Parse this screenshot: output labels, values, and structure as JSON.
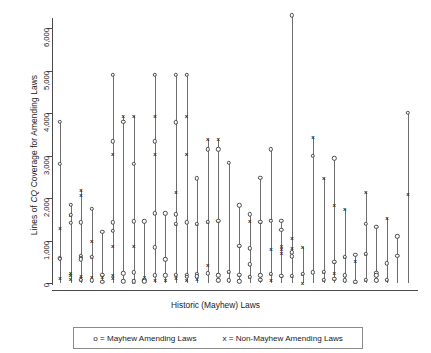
{
  "chart_data": {
    "type": "scatter",
    "title": "",
    "xlabel": "Historic (Mayhew) Laws",
    "ylabel": "Lines of CQ Coverage for Amending Laws",
    "ylabel_parts": {
      "pre": "Lines of ",
      "italic": "CQ",
      "post": " Coverage for Amending Laws"
    },
    "ylim": [
      0,
      6500
    ],
    "yticks": [
      0,
      1000,
      2000,
      3000,
      4000,
      5000,
      6000
    ],
    "ytick_labels": [
      "0",
      "1,000",
      "2,000",
      "3,000",
      "4,000",
      "5,000",
      "6,000"
    ],
    "grid": false,
    "xtick_labels": [],
    "legend": {
      "position": "below-axis-box",
      "entries": [
        {
          "marker": "o",
          "label": "o = Mayhew Amending Laws"
        },
        {
          "marker": "x",
          "label": "x = Non-Mayhew Amending Laws"
        }
      ]
    },
    "series": [
      {
        "name": "Mayhew Amending Laws",
        "marker": "o"
      },
      {
        "name": "Non-Mayhew Amending Laws",
        "marker": "x"
      }
    ],
    "stems": [
      {
        "x": 1,
        "top": 3800,
        "o": [
          3800,
          2800,
          580,
          570
        ],
        "xs": [
          1300,
          120
        ]
      },
      {
        "x": 2,
        "top": 1840,
        "o": [
          1840,
          1600,
          1420
        ],
        "xs": [
          1600,
          240,
          180,
          90
        ]
      },
      {
        "x": 3,
        "top": 2200,
        "o": [
          1430,
          640,
          600,
          560,
          80
        ],
        "xs": [
          2200,
          2080,
          640,
          600,
          170,
          120,
          60
        ]
      },
      {
        "x": 4,
        "top": 1740,
        "o": [
          1740,
          620,
          60
        ],
        "xs": [
          1000,
          620,
          150
        ]
      },
      {
        "x": 5,
        "top": 1200,
        "o": [
          1200,
          200,
          30
        ],
        "xs": [
          200,
          140
        ]
      },
      {
        "x": 6,
        "top": 4900,
        "o": [
          4900,
          3330,
          1430,
          1230
        ],
        "xs": [
          3030,
          880,
          200,
          120
        ]
      },
      {
        "x": 7,
        "top": 3940,
        "o": [
          3800,
          230,
          40
        ],
        "xs": [
          3940,
          40
        ]
      },
      {
        "x": 8,
        "top": 3920,
        "o": [
          2800,
          1450,
          250,
          40
        ],
        "xs": [
          3920,
          880,
          60,
          30
        ]
      },
      {
        "x": 9,
        "top": 1450,
        "o": [
          1450,
          60,
          40
        ],
        "xs": [
          130,
          60
        ]
      },
      {
        "x": 10,
        "top": 4900,
        "o": [
          4900,
          3330,
          1640,
          840,
          180
        ],
        "xs": [
          3940,
          3030,
          1640,
          180,
          80
        ]
      },
      {
        "x": 11,
        "top": 1640,
        "o": [
          1640,
          560,
          180
        ],
        "xs": [
          560,
          180,
          70
        ]
      },
      {
        "x": 12,
        "top": 4900,
        "o": [
          4900,
          3780,
          1620,
          1400,
          200
        ],
        "xs": [
          3800,
          2150,
          1620,
          1400,
          200,
          120
        ]
      },
      {
        "x": 13,
        "top": 4900,
        "o": [
          4900,
          1430,
          200,
          150
        ],
        "xs": [
          3940,
          3030,
          1430,
          200,
          80
        ]
      },
      {
        "x": 14,
        "top": 2460,
        "o": [
          2460,
          1400,
          220,
          160
        ],
        "xs": [
          1400,
          220,
          160,
          90
        ]
      },
      {
        "x": 15,
        "top": 3400,
        "o": [
          3150,
          1440,
          230
        ],
        "xs": [
          3400,
          1440,
          420,
          230
        ]
      },
      {
        "x": 16,
        "top": 3400,
        "o": [
          3150,
          1460,
          180,
          60
        ],
        "xs": [
          3400,
          1460,
          220,
          60
        ]
      },
      {
        "x": 17,
        "top": 2830,
        "o": [
          2830,
          260,
          60
        ],
        "xs": [
          260,
          60
        ]
      },
      {
        "x": 18,
        "top": 1830,
        "o": [
          1830,
          880,
          190,
          40
        ],
        "xs": [
          880,
          190,
          60
        ]
      },
      {
        "x": 19,
        "top": 1620,
        "o": [
          1620,
          820,
          440,
          150
        ],
        "xs": [
          1460,
          820,
          440,
          150
        ]
      },
      {
        "x": 20,
        "top": 2470,
        "o": [
          2470,
          1440,
          180,
          70
        ],
        "xs": [
          1440,
          180,
          70
        ]
      },
      {
        "x": 21,
        "top": 3150,
        "o": [
          3150,
          1460,
          210
        ],
        "xs": [
          1490,
          790,
          210,
          60
        ]
      },
      {
        "x": 22,
        "top": 1470,
        "o": [
          1470,
          1250,
          170
        ],
        "xs": [
          880,
          790,
          700,
          170
        ]
      },
      {
        "x": 23,
        "top": 6300,
        "o": [
          6300,
          720,
          630,
          170
        ],
        "xs": [
          1060,
          830,
          720,
          630,
          170
        ]
      },
      {
        "x": 24,
        "top": 840,
        "o": [
          220
        ],
        "xs": [
          840,
          220,
          0
        ]
      },
      {
        "x": 25,
        "top": 3430,
        "o": [
          3000,
          250
        ],
        "xs": [
          3430,
          250
        ]
      },
      {
        "x": 26,
        "top": 2470,
        "o": [
          260,
          80
        ],
        "xs": [
          2470,
          260,
          80
        ]
      },
      {
        "x": 27,
        "top": 2930,
        "o": [
          2930,
          500,
          100
        ],
        "xs": [
          1830,
          500,
          230,
          100
        ]
      },
      {
        "x": 28,
        "top": 1750,
        "o": [
          620,
          180,
          60
        ],
        "xs": [
          1750,
          620,
          180,
          60
        ]
      },
      {
        "x": 29,
        "top": 660,
        "o": [
          660,
          30
        ],
        "xs": [
          520,
          30
        ]
      },
      {
        "x": 30,
        "top": 2130,
        "o": [
          1400,
          680,
          80
        ],
        "xs": [
          2130,
          680,
          80
        ]
      },
      {
        "x": 31,
        "top": 1320,
        "o": [
          1320,
          240,
          180,
          60
        ],
        "xs": [
          240,
          180,
          60
        ]
      },
      {
        "x": 32,
        "top": 1530,
        "o": [
          460,
          70
        ],
        "xs": [
          1530,
          70
        ]
      },
      {
        "x": 33,
        "top": 1100,
        "o": [
          1100,
          640
        ],
        "xs": [
          1100
        ]
      },
      {
        "x": 34,
        "top": 4010,
        "o": [
          4010
        ],
        "xs": [
          2100
        ]
      }
    ]
  }
}
